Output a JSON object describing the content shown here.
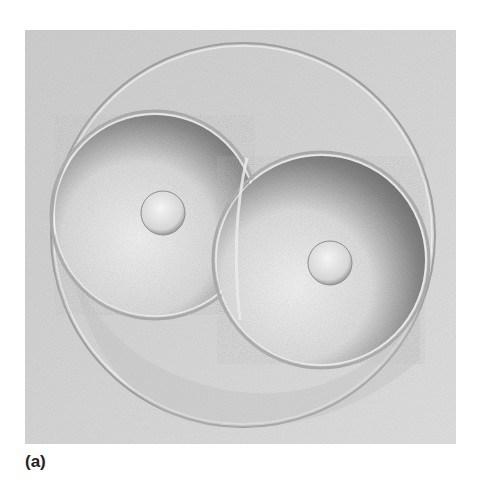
{
  "figure": {
    "panel_label": "(a)",
    "elements": {
      "zona": "outer membrane circle",
      "cells": [
        {
          "name": "left blastomere",
          "has_nucleus": true
        },
        {
          "name": "right blastomere",
          "has_nucleus": true
        }
      ]
    },
    "colors": {
      "background": "#ffffff",
      "photo_mid": "#d0d0d0",
      "cell_dark": "#7a7a7a",
      "cell_light": "#eeeeee"
    }
  }
}
